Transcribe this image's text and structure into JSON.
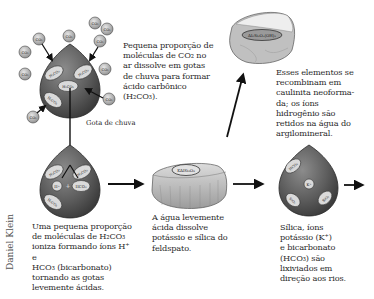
{
  "diagram": {
    "type": "process-flow",
    "credit": "Daniel Klein",
    "raindrop_label": "Gota de chuva",
    "colors": {
      "drop_fill": "#5a5a5a",
      "drop_highlight": "#8a8a8a",
      "oval_fill": "#d8d8d8",
      "molecule_fill": "#bdbdbd",
      "arrow": "#111111",
      "rock_fill": "#c8c8c8"
    },
    "captions": {
      "step1": "Pequena proporção de moléculas de CO2 no ar dissolve em gotas de chuva para formar ácido carbônico (H2CO3).",
      "step2": "Uma pequena proporção de moléculas de H2CO3 ioniza formando íons H+ e HCO3 (bicarbonato) tornando as gotas levemente ácidas.",
      "step3": "A água levemente ácida dissolve potássio e sílica do feldspato.",
      "step4": "Esses elementos se recombinam em caulinita neoforma-da; os íons hidrogênio são retidos na água do argilomineral.",
      "step5": "Sílica, íons potássio (K+) e bicarbonato (HCO3) são lixiviados em direção aos rios."
    },
    "caption_lines": {
      "step1": [
        "Pequena proporção de",
        "moléculas de CO₂ no",
        "ar dissolve em gotas",
        "de chuva para formar",
        "ácido carbônico",
        "(H₂CO₃)."
      ],
      "step2": [
        "Uma pequena proporção",
        "de moléculas de H₂CO₃",
        "ioniza formando íons H⁺ e",
        "HCO₃ (bicarbonato)",
        "tornando as gotas",
        "levemente ácidas."
      ],
      "step3": [
        "A água levemente",
        "ácida dissolve",
        "potássio e sílica do",
        "feldspato."
      ],
      "step4": [
        "Esses elementos se",
        "recombinam em",
        "caulinita neoforma-",
        "da; os íons",
        "hidrogênio são",
        "retidos na água do",
        "argilomineral."
      ],
      "step5": [
        "Sílica, íons",
        "potássio (K⁺)",
        "e bicarbonato",
        "(HCO₃) são",
        "lixiviados em",
        "direção aos rios."
      ]
    },
    "molecules": {
      "co2": "CO₂",
      "h2co3": "H₂CO₃",
      "h_ion": "H⁺",
      "hco3": "HCO₃",
      "k_ion": "K⁺",
      "sio2": "SiO₂",
      "feldspar": "KAlSi₃O₈",
      "kaolinite": "Al₂Si₂O₅(OH)₄"
    }
  }
}
